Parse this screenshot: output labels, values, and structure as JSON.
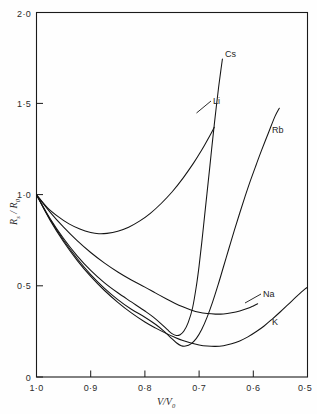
{
  "figure": {
    "background_color": "#fefefe",
    "line_color": "#141414",
    "axis_color": "#1a1a1a"
  },
  "axes": {
    "y_title": "R",
    "y_title_sub": "s",
    "y_title_mid": " / R",
    "y_title_sub2": "0",
    "x_title": "V",
    "x_title_mid": "/V",
    "x_title_sub": "0",
    "y_ticks": [
      "0",
      "0·5",
      "1·0",
      "1·5",
      "2·0"
    ],
    "x_ticks": [
      "1·0",
      "0·9",
      "0·8",
      "0·7",
      "0·6",
      "0·5"
    ]
  },
  "curve_labels": {
    "cs": "Cs",
    "li": "Li",
    "rb": "Rb",
    "na": "Na",
    "k": "K"
  },
  "chart_data": {
    "type": "line",
    "title": "",
    "xlabel": "V/V0",
    "ylabel": "Rs / R0",
    "xlim": [
      1.0,
      0.5
    ],
    "ylim": [
      0.0,
      2.0
    ],
    "x_reversed": true,
    "grid": false,
    "legend": "inline-curve-labels",
    "series": [
      {
        "name": "Li",
        "label_position": {
          "x": 0.695,
          "y": 1.47
        },
        "points": [
          [
            1.0,
            1.0
          ],
          [
            0.98,
            0.93
          ],
          [
            0.96,
            0.88
          ],
          [
            0.94,
            0.84
          ],
          [
            0.92,
            0.812
          ],
          [
            0.9,
            0.793
          ],
          [
            0.885,
            0.786
          ],
          [
            0.87,
            0.788
          ],
          [
            0.85,
            0.8
          ],
          [
            0.83,
            0.822
          ],
          [
            0.81,
            0.855
          ],
          [
            0.79,
            0.898
          ],
          [
            0.77,
            0.952
          ],
          [
            0.75,
            1.015
          ],
          [
            0.73,
            1.09
          ],
          [
            0.71,
            1.175
          ],
          [
            0.7,
            1.222
          ],
          [
            0.69,
            1.272
          ],
          [
            0.68,
            1.325
          ],
          [
            0.672,
            1.37
          ]
        ]
      },
      {
        "name": "Cs",
        "label_position": {
          "x": 0.688,
          "y": 1.775
        },
        "points": [
          [
            1.0,
            1.0
          ],
          [
            0.975,
            0.87
          ],
          [
            0.95,
            0.76
          ],
          [
            0.925,
            0.665
          ],
          [
            0.9,
            0.585
          ],
          [
            0.875,
            0.518
          ],
          [
            0.85,
            0.462
          ],
          [
            0.825,
            0.412
          ],
          [
            0.8,
            0.362
          ],
          [
            0.785,
            0.33
          ],
          [
            0.77,
            0.292
          ],
          [
            0.758,
            0.258
          ],
          [
            0.75,
            0.238
          ],
          [
            0.742,
            0.228
          ],
          [
            0.735,
            0.232
          ],
          [
            0.728,
            0.252
          ],
          [
            0.72,
            0.3
          ],
          [
            0.712,
            0.38
          ],
          [
            0.705,
            0.5
          ],
          [
            0.7,
            0.61
          ],
          [
            0.695,
            0.74
          ],
          [
            0.69,
            0.88
          ],
          [
            0.685,
            1.02
          ],
          [
            0.68,
            1.16
          ],
          [
            0.676,
            1.275
          ],
          [
            0.672,
            1.385
          ],
          [
            0.668,
            1.49
          ],
          [
            0.664,
            1.59
          ],
          [
            0.66,
            1.68
          ],
          [
            0.657,
            1.745
          ]
        ]
      },
      {
        "name": "Rb",
        "label_position": {
          "x": 0.585,
          "y": 1.345
        },
        "points": [
          [
            1.0,
            1.0
          ],
          [
            0.975,
            0.865
          ],
          [
            0.95,
            0.75
          ],
          [
            0.925,
            0.65
          ],
          [
            0.9,
            0.562
          ],
          [
            0.875,
            0.488
          ],
          [
            0.85,
            0.425
          ],
          [
            0.825,
            0.372
          ],
          [
            0.8,
            0.328
          ],
          [
            0.78,
            0.288
          ],
          [
            0.765,
            0.252
          ],
          [
            0.752,
            0.215
          ],
          [
            0.742,
            0.188
          ],
          [
            0.733,
            0.172
          ],
          [
            0.725,
            0.17
          ],
          [
            0.715,
            0.182
          ],
          [
            0.705,
            0.212
          ],
          [
            0.695,
            0.262
          ],
          [
            0.685,
            0.33
          ],
          [
            0.675,
            0.412
          ],
          [
            0.665,
            0.505
          ],
          [
            0.655,
            0.605
          ],
          [
            0.645,
            0.705
          ],
          [
            0.635,
            0.805
          ],
          [
            0.625,
            0.9
          ],
          [
            0.615,
            0.992
          ],
          [
            0.605,
            1.08
          ],
          [
            0.595,
            1.162
          ],
          [
            0.585,
            1.242
          ],
          [
            0.572,
            1.34
          ],
          [
            0.56,
            1.43
          ],
          [
            0.552,
            1.475
          ]
        ]
      },
      {
        "name": "Na",
        "label_position": {
          "x": 0.578,
          "y": 0.45
        },
        "points": [
          [
            1.0,
            1.0
          ],
          [
            0.975,
            0.905
          ],
          [
            0.95,
            0.822
          ],
          [
            0.925,
            0.748
          ],
          [
            0.9,
            0.683
          ],
          [
            0.875,
            0.626
          ],
          [
            0.85,
            0.576
          ],
          [
            0.825,
            0.532
          ],
          [
            0.8,
            0.493
          ],
          [
            0.78,
            0.46
          ],
          [
            0.76,
            0.428
          ],
          [
            0.745,
            0.405
          ],
          [
            0.73,
            0.385
          ],
          [
            0.715,
            0.368
          ],
          [
            0.7,
            0.355
          ],
          [
            0.685,
            0.348
          ],
          [
            0.67,
            0.345
          ],
          [
            0.655,
            0.346
          ],
          [
            0.64,
            0.352
          ],
          [
            0.625,
            0.362
          ],
          [
            0.61,
            0.377
          ],
          [
            0.6,
            0.39
          ],
          [
            0.592,
            0.402
          ]
        ]
      },
      {
        "name": "K",
        "label_position": {
          "x": 0.565,
          "y": 0.295
        },
        "points": [
          [
            1.0,
            1.0
          ],
          [
            0.975,
            0.86
          ],
          [
            0.95,
            0.742
          ],
          [
            0.925,
            0.64
          ],
          [
            0.9,
            0.552
          ],
          [
            0.875,
            0.476
          ],
          [
            0.85,
            0.41
          ],
          [
            0.825,
            0.352
          ],
          [
            0.8,
            0.302
          ],
          [
            0.78,
            0.268
          ],
          [
            0.76,
            0.238
          ],
          [
            0.745,
            0.218
          ],
          [
            0.73,
            0.2
          ],
          [
            0.715,
            0.186
          ],
          [
            0.7,
            0.176
          ],
          [
            0.685,
            0.17
          ],
          [
            0.67,
            0.168
          ],
          [
            0.655,
            0.172
          ],
          [
            0.64,
            0.182
          ],
          [
            0.625,
            0.198
          ],
          [
            0.61,
            0.22
          ],
          [
            0.595,
            0.248
          ],
          [
            0.58,
            0.28
          ],
          [
            0.565,
            0.318
          ],
          [
            0.55,
            0.358
          ],
          [
            0.535,
            0.4
          ],
          [
            0.52,
            0.442
          ],
          [
            0.505,
            0.482
          ],
          [
            0.5,
            0.492
          ]
        ]
      }
    ]
  }
}
